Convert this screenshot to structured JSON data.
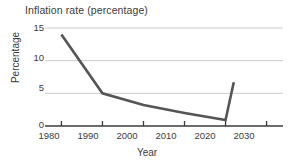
{
  "chart_data": {
    "type": "line",
    "title": "Inflation rate (percentage)",
    "xlabel": "Year",
    "ylabel": "Percentage",
    "x": [
      1980,
      1990,
      2000,
      2010,
      2020,
      2022
    ],
    "values": [
      14.0,
      5.0,
      3.2,
      2.0,
      0.9,
      6.7
    ],
    "series": [
      {
        "name": "Inflation rate",
        "x": [
          1980,
          1990,
          2000,
          2010,
          2020,
          2022
        ],
        "values": [
          14.0,
          5.0,
          3.2,
          2.0,
          0.9,
          6.7
        ]
      }
    ],
    "xlim": [
      1976,
      2034
    ],
    "ylim": [
      0,
      15.6
    ],
    "xticks": [
      1980,
      1990,
      2000,
      2010,
      2020,
      2030
    ],
    "xtick_labels": [
      "1980",
      "1990",
      "2000",
      "2010",
      "2020",
      "2030"
    ],
    "yticks": [
      0,
      5,
      10,
      15
    ],
    "ytick_labels": [
      "0",
      "5",
      "10",
      "15"
    ],
    "grid": "horizontal",
    "legend": "none",
    "colors": {
      "line": "#555555",
      "gridline": "#cccccc",
      "axis": "#3b3b3b",
      "text": "#3b3b3b",
      "background": "#ffffff"
    }
  }
}
